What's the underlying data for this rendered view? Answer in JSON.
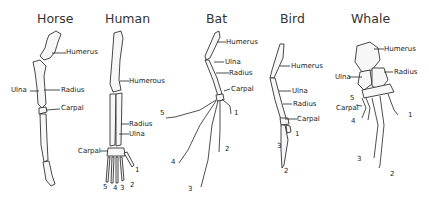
{
  "diagram": {
    "panels": [
      {
        "animal": "Horse",
        "labels": {
          "humerus": "Humerus",
          "ulna": "Ulna",
          "radius": "Radius",
          "carpal": "Carpal"
        }
      },
      {
        "animal": "Human",
        "labels": {
          "humerus": "Humerous",
          "radius": "Radius",
          "ulna": "Ulna",
          "carpal": "Carpal"
        },
        "digits": [
          "1",
          "2",
          "3",
          "4",
          "5"
        ]
      },
      {
        "animal": "Bat",
        "labels": {
          "humerus": "Humerus",
          "ulna": "Ulna",
          "radius": "Radius",
          "carpal": "Carpal"
        },
        "digits": [
          "1",
          "2",
          "3",
          "4",
          "5"
        ]
      },
      {
        "animal": "Bird",
        "labels": {
          "humerus": "Humerus",
          "ulna": "Ulna",
          "radius": "Radius",
          "carpal": "Carpal"
        },
        "digits": [
          "1",
          "2",
          "3"
        ]
      },
      {
        "animal": "Whale",
        "labels": {
          "humerus": "Humerus",
          "ulna": "Ulna",
          "radius": "Radius",
          "carpal": "Carpal"
        },
        "digits": [
          "1",
          "2",
          "3",
          "4",
          "5"
        ]
      }
    ]
  }
}
